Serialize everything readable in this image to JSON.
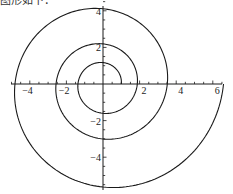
{
  "caption": "图形如下：",
  "chart_data": {
    "type": "line",
    "title": "",
    "xlabel": "",
    "ylabel": "",
    "equation": "r = e^(0.1*theta)",
    "theta_range": [
      0,
      18.8496
    ],
    "xlim": [
      -5.2,
      6.7
    ],
    "ylim": [
      -5.9,
      4.3
    ],
    "grid": false,
    "legend": null,
    "x_ticks": [
      {
        "value": -4,
        "label": "−4"
      },
      {
        "value": -2,
        "label": "−2"
      },
      {
        "value": 2,
        "label": "2"
      },
      {
        "value": 4,
        "label": "4"
      },
      {
        "value": 6,
        "label": "6"
      }
    ],
    "y_ticks": [
      {
        "value": 4,
        "label": "4"
      },
      {
        "value": 2,
        "label": "2"
      },
      {
        "value": -2,
        "label": "−2"
      },
      {
        "value": -4,
        "label": "−4"
      }
    ],
    "minor_tick_step": 0.5,
    "axis_crossings": {
      "positive_x": [
        1.0,
        1.87,
        3.51,
        6.59
      ],
      "negative_x": [
        -1.37,
        -2.57,
        -4.81
      ],
      "positive_y": [
        1.17,
        2.19,
        4.11
      ],
      "negative_y": [
        -1.6,
        -3.0,
        -5.63
      ]
    },
    "line_color": "#1a1a1a"
  }
}
